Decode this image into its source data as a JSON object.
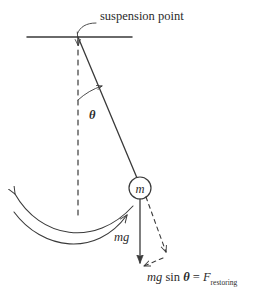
{
  "figure": {
    "background_color": "#ffffff",
    "stroke_color": "#3a3a3a",
    "text_color": "#2b2b2b",
    "labels": {
      "suspension_point": "suspension point",
      "angle_symbol": "θ",
      "bob_mass_symbol": "m",
      "weight_vector": "mg",
      "restoring_force_mg": "mg",
      "restoring_force_sin": " sin ",
      "restoring_force_theta": "θ",
      "restoring_force_equals": " = ",
      "restoring_force_F": "F",
      "restoring_force_subscript": "restoring"
    },
    "geometry": {
      "support_bar": {
        "x1": 27,
        "y1": 37,
        "x2": 132,
        "y2": 37
      },
      "suspension_point": {
        "x": 78,
        "y": 37
      },
      "bob_center": {
        "x": 140,
        "y": 188
      },
      "bob_radius": 11,
      "vertical_dashed_end_y": 215,
      "weight_arrow_end": {
        "x": 140,
        "y": 263
      },
      "component_arrow_end": {
        "x": 166,
        "y": 256
      }
    }
  }
}
